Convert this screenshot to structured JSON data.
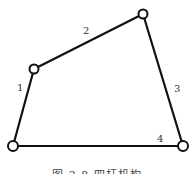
{
  "diagram": {
    "type": "four-bar-linkage",
    "joints": [
      {
        "id": "A",
        "x": 34,
        "y": 69
      },
      {
        "id": "B",
        "x": 143,
        "y": 14
      },
      {
        "id": "C",
        "x": 183,
        "y": 146
      },
      {
        "id": "D",
        "x": 13,
        "y": 146
      }
    ],
    "links": [
      {
        "label": "1",
        "from": "D",
        "to": "A",
        "label_x": 20,
        "label_y": 90
      },
      {
        "label": "2",
        "from": "A",
        "to": "B",
        "label_x": 86,
        "label_y": 33
      },
      {
        "label": "3",
        "from": "B",
        "to": "C",
        "label_x": 177,
        "label_y": 91
      },
      {
        "label": "4",
        "from": "C",
        "to": "D",
        "label_x": 160,
        "label_y": 141
      }
    ],
    "caption": "图 2-8  四杆机构"
  }
}
